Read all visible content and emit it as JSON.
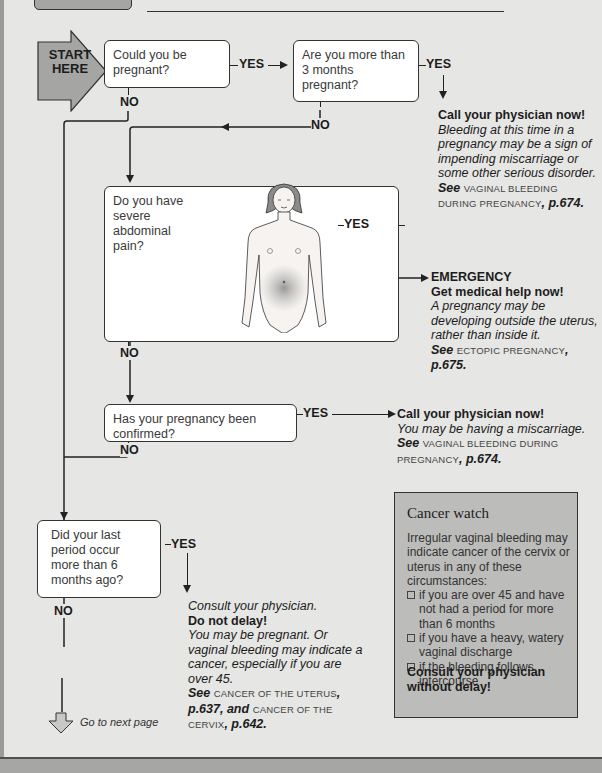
{
  "header": {
    "text_fragment": "pregnancy (see box, right) — continued"
  },
  "start": {
    "label_line1": "START",
    "label_line2": "HERE"
  },
  "questions": [
    {
      "id": "q1",
      "text": "Could you be pregnant?",
      "yes": "YES",
      "no": "NO"
    },
    {
      "id": "q2",
      "text": "Are you more than 3 months pregnant?",
      "yes": "YES",
      "no": "NO"
    },
    {
      "id": "q3",
      "text": "Do you have severe abdominal pain?",
      "yes": "YES",
      "no": "NO"
    },
    {
      "id": "q4",
      "text": "Has your pregnancy been confirmed?",
      "yes": "YES",
      "no": "NO"
    },
    {
      "id": "q5",
      "text": "Did your last period occur more than 6 months ago?",
      "yes": "YES",
      "no": "NO"
    }
  ],
  "outcomes": {
    "q2_yes": {
      "heading": "Call your physician now!",
      "body": "Bleeding at this time in a pregnancy may be a sign of impending miscarriage or some other serious disorder.",
      "see": "See",
      "ref": "VAGINAL BLEEDING DURING PREGNANCY",
      "page": ", p.674."
    },
    "q3_yes": {
      "tag": "EMERGENCY",
      "heading": "Get medical help now!",
      "body": "A pregnancy may be developing outside the uterus, rather than inside it.",
      "see": "See",
      "ref": "ECTOPIC PREGNANCY",
      "page": ", p.675."
    },
    "q4_yes": {
      "heading": "Call your  physician now!",
      "body": "You may be having a miscarriage.",
      "see": "See",
      "ref": "VAGINAL BLEEDING DURING PREGNANCY",
      "page": ", p.674."
    },
    "q5_yes": {
      "pre": "Consult your physician.",
      "heading": "Do not delay!",
      "body": "You may be pregnant. Or vaginal bleeding may indicate a cancer, especially if you are over 45.",
      "see": "See",
      "ref1": "CANCER OF THE UTERUS",
      "page1": ", p.637, and",
      "ref2": "CANCER OF THE CERVIX",
      "page2": ", p.642."
    }
  },
  "cancer_watch": {
    "title": "Cancer watch",
    "intro": "Irregular vaginal bleeding may indicate cancer of the cervix or uterus in any of these circumstances:",
    "items": [
      "if you are over 45 and have not had a period for more than 6 months",
      "if you have a heavy, watery vaginal discharge",
      "if the bleeding follows intercourse"
    ],
    "cta": "Consult your physician without delay!"
  },
  "footer": {
    "next": "Go to next page"
  },
  "colors": {
    "page_bg": "#e6e6e4",
    "box_bg": "#ffffff",
    "sidebar_bg": "#bcbcba",
    "start_fill": "#a5a5a3",
    "line": "#222222"
  }
}
